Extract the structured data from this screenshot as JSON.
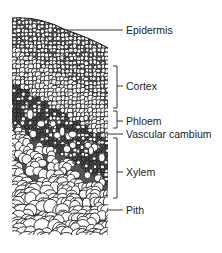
{
  "figure": {
    "line_color": "#222222",
    "background": "#ffffff"
  },
  "labels": [
    {
      "id": "epidermis",
      "text": "Epidermis",
      "type": "line",
      "y": 30
    },
    {
      "id": "cortex",
      "text": "Cortex",
      "type": "bracket",
      "y": 86,
      "bracket": [
        66,
        108
      ]
    },
    {
      "id": "phloem",
      "text": "Phloem",
      "type": "bracket",
      "y": 121,
      "bracket": [
        111,
        128
      ]
    },
    {
      "id": "vascular-cambium",
      "text": "Vascular cambium",
      "type": "line",
      "y": 134
    },
    {
      "id": "xylem",
      "text": "Xylem",
      "type": "bracket",
      "y": 172,
      "bracket": [
        138,
        198
      ]
    },
    {
      "id": "pith",
      "text": "Pith",
      "type": "line",
      "y": 210
    }
  ]
}
